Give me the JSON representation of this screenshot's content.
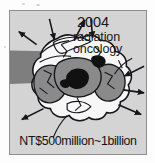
{
  "figure": {
    "title_label": "radiation oncology budget diagram",
    "annotations": {
      "year": "2004",
      "department_line_1": "radiation",
      "department_line_2": "oncology"
    },
    "caption": "NT$500million~1billion",
    "colors": {
      "panel_background": "#d4d4d4",
      "panel_border": "#8e8e8e",
      "blob_dark": "#8a8a8a",
      "blob_darkest": "#111111",
      "blob_light": "#f7f7f7",
      "outline": "#16161a",
      "text": "#17171a",
      "page_background": "#ffffff"
    },
    "arrows": [
      {
        "name": "arrow-top-left-outward",
        "direction": "up-left"
      },
      {
        "name": "arrow-top-inward-left",
        "direction": "down"
      },
      {
        "name": "arrow-top-inward-center",
        "direction": "up-right"
      },
      {
        "name": "arrow-top-inward-right",
        "direction": "down"
      },
      {
        "name": "arrow-right-inward",
        "direction": "down-left"
      },
      {
        "name": "arrow-right-outward-upper",
        "direction": "right"
      },
      {
        "name": "arrow-right-outward-lower",
        "direction": "down-right"
      },
      {
        "name": "arrow-bottom-left-outward",
        "direction": "down-left"
      },
      {
        "name": "arrow-bottom-right-outward",
        "direction": "down-right"
      }
    ],
    "shapes": {
      "band_label": "horizontal dark band from left edge",
      "blob_label": "lobed cell-like cluster"
    }
  }
}
